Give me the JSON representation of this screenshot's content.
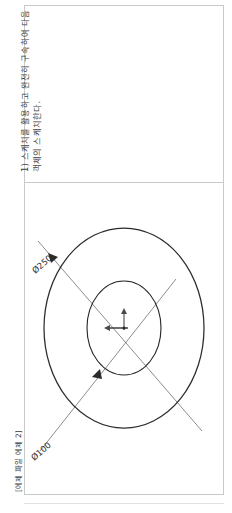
{
  "document": {
    "caption": "[예제 파일 예제 2]",
    "instruction": {
      "line1": "1) 스케치를 활용하고 완전히 구속하여 다음",
      "line2": "객체의 스케치한다."
    }
  },
  "drawing": {
    "type": "technical-drawing",
    "title": "concentric-circles-sketch",
    "entities": [
      {
        "name": "outer-circle",
        "shape": "circle",
        "diameter_label": "Ø250",
        "center": {
          "x": 100,
          "y": 145
        },
        "radius_x": 80,
        "radius_y": 100
      },
      {
        "name": "inner-circle",
        "shape": "circle",
        "diameter_label": "Ø100",
        "center": {
          "x": 100,
          "y": 145
        },
        "radius_x": 37,
        "radius_y": 47
      }
    ],
    "dimensions": [
      {
        "name": "outer-diameter-dimension",
        "label": "Ø250",
        "angle_deg": -41
      },
      {
        "name": "inner-diameter-dimension",
        "label": "Ø100",
        "angle_deg": -41
      }
    ],
    "origin_marker": {
      "name": "sketch-origin",
      "x": 100,
      "y": 145
    },
    "colors": {
      "geometry_stroke": "#2b2b2b",
      "dimension_stroke": "#555555",
      "frame_border": "#c9c9c9",
      "page_background": "#ffffff"
    }
  }
}
